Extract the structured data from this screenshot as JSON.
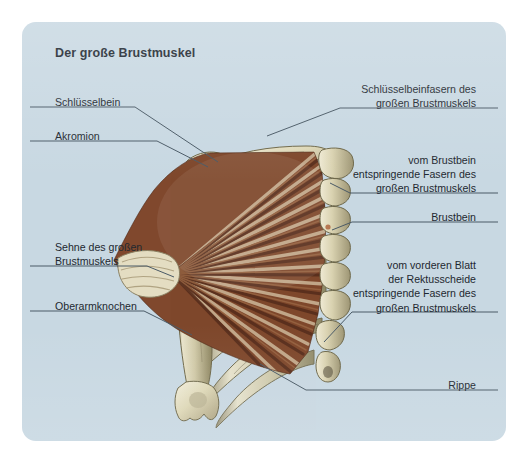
{
  "figure": {
    "title": "Der große Brustmuskel",
    "panel_color": "#c8d8e2",
    "page_color": "#ffffff",
    "leader_color": "#4a5a66",
    "text_color": "#1e2830",
    "bone_color": "#ded9bd",
    "muscle_dark": "#6b3a25",
    "muscle_light": "#d8c0a0"
  },
  "labels": {
    "clavicle": "Schlüsselbein",
    "acromion": "Akromion",
    "pec_tendon": "Sehne des großen\nBrustmuskels",
    "humerus": "Oberarmknochen",
    "clavicular_fibers": "Schlüsselbeinfasern des\ngroßen Brustmuskels",
    "sternal_fibers": "vom Brustbein\nentspringende Fasern des\ngroßen Brustmuskels",
    "sternum": "Brustbein",
    "rectus_fibers": "vom vorderen Blatt\nder Rektusscheide\nentspringende Fasern des\ngroßen Brustmuskels",
    "rib": "Rippe"
  },
  "anatomy": {
    "muscle_name": "pectoralis-major",
    "bones": [
      "clavicle",
      "acromion",
      "scapula",
      "humerus",
      "sternum",
      "ribs"
    ]
  }
}
